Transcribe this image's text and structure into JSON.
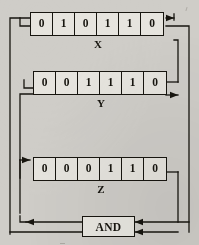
{
  "diagram": {
    "background_color": "#cfcdc8",
    "line_color": "#17150f",
    "registers": [
      {
        "name": "X",
        "label": "X",
        "bits": [
          "0",
          "1",
          "0",
          "1",
          "1",
          "0"
        ]
      },
      {
        "name": "Y",
        "label": "Y",
        "bits": [
          "0",
          "0",
          "1",
          "1",
          "1",
          "0"
        ]
      },
      {
        "name": "Z",
        "label": "Z",
        "bits": [
          "0",
          "0",
          "0",
          "1",
          "1",
          "0"
        ]
      }
    ],
    "gate": {
      "label": "AND",
      "type": "and-gate"
    }
  }
}
